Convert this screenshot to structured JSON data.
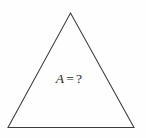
{
  "figure": {
    "kind": "geometry-diagram",
    "shape_name": "triangle",
    "background_color": "#fefefe",
    "stroke_color": "#3c3c3c",
    "text_color": "#262626",
    "canvas": {
      "width": 146,
      "height": 138
    },
    "vertices": {
      "apex": {
        "x": 70.5,
        "y": 13
      },
      "bottom_left": {
        "x": 8,
        "y": 127.5
      },
      "bottom_right": {
        "x": 134,
        "y": 127.5
      }
    },
    "polygon_points": "70.5,13 134,127.5 8,127.5"
  },
  "label": {
    "symbol": "A",
    "equals": "=",
    "value": "?",
    "full_text": "A = ?"
  }
}
